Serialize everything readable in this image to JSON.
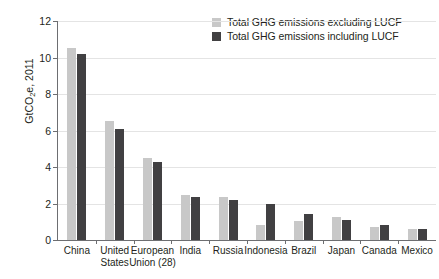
{
  "chart_data": {
    "type": "bar",
    "title": "",
    "subtitle": "",
    "xlabel": "",
    "ylabel": "GtCO2e, 2011",
    "ylabel_parts": {
      "pre": "GtCO",
      "sub": "2",
      "post": "e, 2011"
    },
    "ylim": [
      0,
      12
    ],
    "yticks": [
      0,
      2,
      4,
      6,
      8,
      10,
      12
    ],
    "ytick_labels": [
      "0",
      "2",
      "4",
      "6",
      "8",
      "10",
      "12"
    ],
    "grid": true,
    "grid_axis": "y",
    "legend_position": "top-right",
    "categories": [
      "China",
      "United States",
      "European Union (28)",
      "India",
      "Russia",
      "Indonesia",
      "Brazil",
      "Japan",
      "Canada",
      "Mexico"
    ],
    "category_label_lines": [
      [
        "China"
      ],
      [
        "United",
        "States"
      ],
      [
        "European",
        "Union (28)"
      ],
      [
        "India"
      ],
      [
        "Russia"
      ],
      [
        "Indonesia"
      ],
      [
        "Brazil"
      ],
      [
        "Japan"
      ],
      [
        "Canada"
      ],
      [
        "Mexico"
      ]
    ],
    "series": [
      {
        "name": "Total GHG emissions excluding LUCF",
        "color": "#c8c8c8",
        "values": [
          10.5,
          6.5,
          4.5,
          2.45,
          2.35,
          0.8,
          1.05,
          1.25,
          0.7,
          0.58
        ]
      },
      {
        "name": "Total GHG emissions including LUCF",
        "color": "#414042",
        "values": [
          10.2,
          6.1,
          4.25,
          2.35,
          2.2,
          2.0,
          1.4,
          1.1,
          0.8,
          0.6
        ]
      }
    ]
  },
  "legend": {
    "entries": [
      {
        "label": "Total GHG emissions excluding LUCF",
        "color": "#c8c8c8"
      },
      {
        "label": "Total GHG emissions including LUCF",
        "color": "#414042"
      }
    ]
  },
  "colors": {
    "excluding_lucf": "#c8c8c8",
    "including_lucf": "#414042",
    "axis": "#6d6e71",
    "gridline": "#e4e4e4",
    "text": "#231f20",
    "background": "#ffffff"
  }
}
